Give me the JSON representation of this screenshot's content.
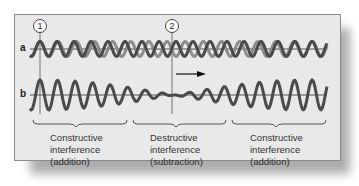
{
  "diagram": {
    "markers": [
      {
        "label": "1",
        "x": 40
      },
      {
        "label": "2",
        "x": 172
      }
    ],
    "rows": [
      {
        "label": "a",
        "description": "two overlapping waves (dark and light gray) of slightly different frequency"
      },
      {
        "label": "b",
        "description": "resultant summed wave"
      }
    ],
    "arrow": {
      "direction": "right"
    },
    "regions": [
      {
        "title": "Constructive",
        "line2": "interference",
        "line3": "(addition)"
      },
      {
        "title": "Destructive",
        "line2": "interference",
        "line3": "(subtraction)"
      },
      {
        "title": "Constructive",
        "line2": "interference",
        "line3": "(addition)"
      }
    ],
    "colors": {
      "panel_bg": "#e9e9e9",
      "wave_dark": "#4a4a4a",
      "wave_light": "#8c8c8c",
      "axis": "#555555"
    }
  }
}
